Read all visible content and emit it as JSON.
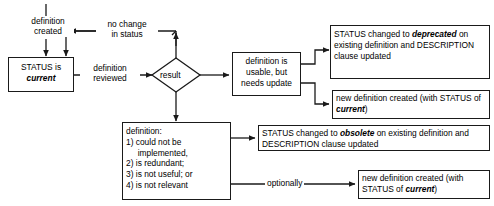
{
  "diagram": {
    "type": "flowchart",
    "title": "",
    "background_color": "#ffffff",
    "stroke_color": "#1a1a1a",
    "text_color": "#000000",
    "entry_label": {
      "line1": "definition",
      "line2": "created"
    },
    "nodes": {
      "status_current": {
        "shape": "rectangle",
        "line1": "STATUS is",
        "line2": "current",
        "line2_emphasis": "bold-italic"
      },
      "result": {
        "shape": "diamond",
        "label": "result"
      },
      "usable_needs_update": {
        "shape": "rectangle",
        "line1": "definition is",
        "line2": "usable, but",
        "line3": "needs update"
      },
      "definition_problems": {
        "shape": "rectangle",
        "heading": "definition:",
        "items": [
          "1) could not be",
          "     implemented,",
          "2) is redundant;",
          "3) is not useful; or",
          "4) is not relevant"
        ]
      },
      "deprecated_update": {
        "shape": "rectangle",
        "seg1": "STATUS changed to ",
        "seg2_emphasis": "deprecated",
        "seg3": " on existing definition and DESCRIPTION clause updated"
      },
      "new_definition_deprecated_path": {
        "shape": "rectangle",
        "seg1": "new definition created (with STATUS of ",
        "seg2_emphasis": "current",
        "seg3": ")"
      },
      "obsolete_update": {
        "shape": "rectangle",
        "seg1": "STATUS changed to ",
        "seg2_emphasis": "obsolete",
        "seg3": " on existing definition and DESCRIPTION clause updated"
      },
      "new_definition_obsolete_path": {
        "shape": "rectangle",
        "seg1": "new definition created (with STATUS of ",
        "seg2_emphasis": "current",
        "seg3": ")"
      }
    },
    "edge_labels": {
      "no_change": {
        "line1": "no change",
        "line2": "in status"
      },
      "definition_reviewed": {
        "line1": "definition",
        "line2": "reviewed"
      },
      "optionally": "optionally"
    }
  }
}
